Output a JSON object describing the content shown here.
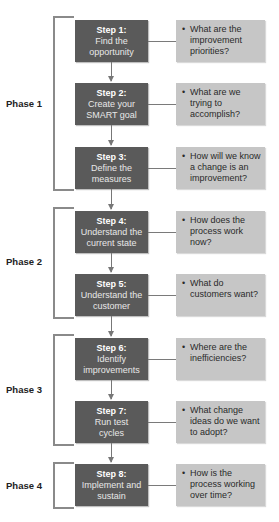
{
  "phases": [
    {
      "label": "Phase 1"
    },
    {
      "label": "Phase 2"
    },
    {
      "label": "Phase 3"
    },
    {
      "label": "Phase 4"
    }
  ],
  "steps": [
    {
      "title": "Step 1:",
      "line1": "Find the",
      "line2": "opportunity",
      "question": "What are the improvement priorities?"
    },
    {
      "title": "Step 2:",
      "line1": "Create your",
      "line2": "SMART goal",
      "question": "What are we trying to accomplish?"
    },
    {
      "title": "Step 3:",
      "line1": "Define the",
      "line2": "measures",
      "question": "How will we know a change is an improvement?"
    },
    {
      "title": "Step 4:",
      "line1": "Understand the",
      "line2": "current state",
      "question": "How does the process work now?"
    },
    {
      "title": "Step 5:",
      "line1": "Understand the",
      "line2": "customer",
      "question": "What do customers want?"
    },
    {
      "title": "Step 6:",
      "line1": "Identify",
      "line2": "improvements",
      "question": "Where are the inefficiencies?"
    },
    {
      "title": "Step 7:",
      "line1": "Run test",
      "line2": "cycles",
      "question": "What change ideas do we want to adopt?"
    },
    {
      "title": "Step 8:",
      "line1": "Implement and",
      "line2": "sustain",
      "question": "How is the process working over time?"
    }
  ],
  "bullet": "•",
  "colors": {
    "step_box": "#5a5a5a",
    "question_box": "#c6c6c6",
    "bracket": "#8a8a8a"
  }
}
